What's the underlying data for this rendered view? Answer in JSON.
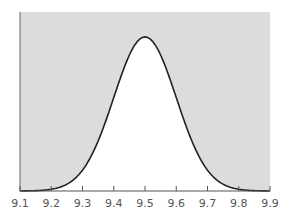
{
  "chart_data": {
    "type": "area",
    "title": "",
    "xlabel": "",
    "ylabel": "",
    "distribution": {
      "mean": 9.5,
      "sd": 0.1
    },
    "x_ticks": [
      "9.1",
      "9.2",
      "9.3",
      "9.4",
      "9.5",
      "9.6",
      "9.7",
      "9.8",
      "9.9"
    ],
    "xlim": [
      9.1,
      9.9
    ],
    "x": [
      9.1,
      9.2,
      9.3,
      9.4,
      9.5,
      9.6,
      9.7,
      9.8,
      9.9
    ],
    "values": [
      0.0003,
      0.0111,
      0.1353,
      0.6065,
      1.0,
      0.6065,
      0.1353,
      0.0111,
      0.0003
    ],
    "grid": false,
    "legend": null,
    "colors": {
      "shade": "#dcdcdc",
      "curve": "#222222",
      "axis": "#555555",
      "background": "#ffffff"
    }
  }
}
